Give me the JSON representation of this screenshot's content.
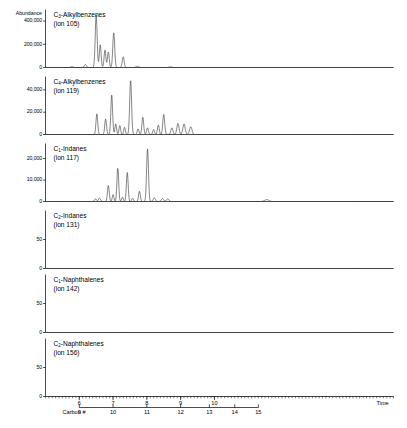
{
  "figure": {
    "y_axis_title": "Abundance",
    "time_axis_label": "Time",
    "carbon_axis_label": "Carbon #"
  },
  "chart_data": {
    "type": "line",
    "title": "",
    "xlabel": "Time",
    "ylabel": "Abundance",
    "grid": false,
    "legend": "none",
    "xlim": [
      5.0,
      15.3
    ],
    "x_ticks": [
      6,
      7,
      8,
      9,
      10
    ],
    "x_tick_labels": [
      "6",
      "7",
      "8",
      "9",
      "10"
    ],
    "secondary_x_axis": {
      "label": "Carbon #",
      "ticks": [
        9,
        10,
        11,
        12,
        13,
        14,
        15
      ],
      "tick_labels": [
        "9",
        "10",
        "11",
        "12",
        "13",
        "14",
        "15"
      ],
      "time_positions": [
        6.0,
        7.0,
        8.0,
        9.0,
        9.85,
        10.6,
        11.3
      ]
    },
    "panels": [
      {
        "id": "c3-alkylbenzenes",
        "label": "C3-Alkylbenzenes",
        "label_prefix": "C",
        "label_sub": "3",
        "label_rest": "-Alkylbenzenes",
        "ion_label": "(ion 105)",
        "ion": 105,
        "ylim": [
          0,
          500000
        ],
        "y_ticks": [
          0,
          200000,
          400000
        ],
        "y_tick_labels": [
          "0",
          "200,000",
          "400,000"
        ],
        "peaks": [
          {
            "t": 5.78,
            "h": 9000,
            "w": 0.03
          },
          {
            "t": 6.18,
            "h": 26000,
            "w": 0.03
          },
          {
            "t": 6.5,
            "h": 455000,
            "w": 0.028
          },
          {
            "t": 6.62,
            "h": 196000,
            "w": 0.026
          },
          {
            "t": 6.76,
            "h": 150000,
            "w": 0.026
          },
          {
            "t": 6.86,
            "h": 134000,
            "w": 0.026
          },
          {
            "t": 7.02,
            "h": 300000,
            "w": 0.028
          },
          {
            "t": 7.3,
            "h": 92000,
            "w": 0.028
          },
          {
            "t": 7.72,
            "h": 11000,
            "w": 0.04
          },
          {
            "t": 8.7,
            "h": 5000,
            "w": 0.05
          }
        ]
      },
      {
        "id": "c4-alkylbenzenes",
        "label": "C4-Alkylbenzenes",
        "label_prefix": "C",
        "label_sub": "4",
        "label_rest": "-Alkylbenzenes",
        "ion_label": "(ion 119)",
        "ion": 119,
        "ylim": [
          0,
          52000
        ],
        "y_ticks": [
          0,
          20000,
          40000
        ],
        "y_tick_labels": [
          "0",
          "20,000",
          "40,000"
        ],
        "peaks": [
          {
            "t": 6.52,
            "h": 18500,
            "w": 0.026
          },
          {
            "t": 6.78,
            "h": 14000,
            "w": 0.026
          },
          {
            "t": 6.96,
            "h": 35500,
            "w": 0.026
          },
          {
            "t": 7.08,
            "h": 9500,
            "w": 0.024
          },
          {
            "t": 7.2,
            "h": 8000,
            "w": 0.024
          },
          {
            "t": 7.34,
            "h": 6500,
            "w": 0.024
          },
          {
            "t": 7.52,
            "h": 48500,
            "w": 0.028
          },
          {
            "t": 7.74,
            "h": 5000,
            "w": 0.026
          },
          {
            "t": 7.88,
            "h": 15500,
            "w": 0.026
          },
          {
            "t": 8.02,
            "h": 6000,
            "w": 0.026
          },
          {
            "t": 8.2,
            "h": 4500,
            "w": 0.026
          },
          {
            "t": 8.34,
            "h": 8500,
            "w": 0.026
          },
          {
            "t": 8.5,
            "h": 18000,
            "w": 0.028
          },
          {
            "t": 8.74,
            "h": 6000,
            "w": 0.03
          },
          {
            "t": 8.92,
            "h": 10000,
            "w": 0.032
          },
          {
            "t": 9.1,
            "h": 9500,
            "w": 0.034
          },
          {
            "t": 9.3,
            "h": 7000,
            "w": 0.036
          }
        ]
      },
      {
        "id": "c1-indanes",
        "label": "C1-Indanes",
        "label_prefix": "C",
        "label_sub": "1",
        "label_rest": "-Indanes",
        "ion_label": "(ion 117)",
        "ion": 117,
        "ylim": [
          0,
          27000
        ],
        "y_ticks": [
          0,
          10000,
          20000
        ],
        "y_tick_labels": [
          "0",
          "10,000",
          "20,000"
        ],
        "peaks": [
          {
            "t": 6.48,
            "h": 1200,
            "w": 0.03
          },
          {
            "t": 6.6,
            "h": 1600,
            "w": 0.03
          },
          {
            "t": 6.86,
            "h": 7500,
            "w": 0.026
          },
          {
            "t": 7.0,
            "h": 3200,
            "w": 0.024
          },
          {
            "t": 7.14,
            "h": 15500,
            "w": 0.026
          },
          {
            "t": 7.28,
            "h": 2000,
            "w": 0.024
          },
          {
            "t": 7.42,
            "h": 13500,
            "w": 0.026
          },
          {
            "t": 7.58,
            "h": 1500,
            "w": 0.026
          },
          {
            "t": 7.78,
            "h": 4800,
            "w": 0.026
          },
          {
            "t": 8.02,
            "h": 24500,
            "w": 0.028
          },
          {
            "t": 8.22,
            "h": 1800,
            "w": 0.03
          },
          {
            "t": 8.46,
            "h": 1400,
            "w": 0.034
          },
          {
            "t": 8.62,
            "h": 1300,
            "w": 0.034
          },
          {
            "t": 11.55,
            "h": 900,
            "w": 0.06
          }
        ]
      },
      {
        "id": "c2-indanes",
        "label": "C2-Indanes",
        "label_prefix": "C",
        "label_sub": "2",
        "label_rest": "-Indanes",
        "ion_label": "(ion 131)",
        "ion": 131,
        "ylim": [
          0,
          100
        ],
        "y_ticks": [
          0,
          50
        ],
        "y_tick_labels": [
          "0",
          "50"
        ],
        "peaks": []
      },
      {
        "id": "c1-naphthalenes",
        "label": "C1-Naphthalenes",
        "label_prefix": "C",
        "label_sub": "1",
        "label_rest": "-Naphthalenes",
        "ion_label": "(ion 142)",
        "ion": 142,
        "ylim": [
          0,
          100
        ],
        "y_ticks": [
          0,
          50
        ],
        "y_tick_labels": [
          "0",
          "50"
        ],
        "peaks": []
      },
      {
        "id": "c2-naphthalenes",
        "label": "C2-Naphthalenes",
        "label_prefix": "C",
        "label_sub": "2",
        "label_rest": "-Naphthalenes",
        "ion_label": "(ion 156)",
        "ion": 156,
        "ylim": [
          0,
          100
        ],
        "y_ticks": [
          0,
          50
        ],
        "y_tick_labels": [
          "0",
          "50"
        ],
        "peaks": []
      }
    ]
  }
}
